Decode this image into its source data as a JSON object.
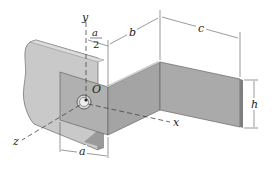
{
  "figure": {
    "colors": {
      "background": "#ffffff",
      "wall_plate": "#c9c9c9",
      "wall_plate_edge": "#a8a8a8",
      "bracket_front": "#b5b5b5",
      "bracket_side": "#9e9e9e",
      "bracket_far": "#a9a9a9",
      "line": "#333333",
      "dim_line": "#555555"
    }
  },
  "axes": {
    "x_label": "x",
    "y_label": "y",
    "z_label": "z",
    "origin_label": "O"
  },
  "dimensions": {
    "a_half_numerator": "a",
    "a_half_denominator": "2",
    "b": "b",
    "c": "c",
    "h": "h",
    "a": "a"
  }
}
